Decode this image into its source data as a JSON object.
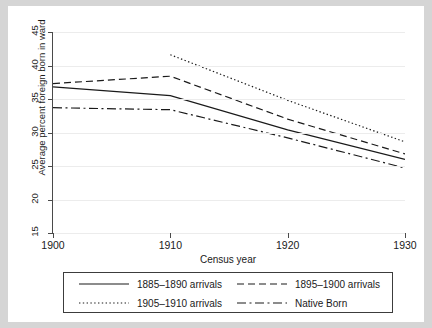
{
  "chart_data": {
    "type": "line",
    "title": "",
    "xlabel": "Census year",
    "ylabel": "Average percent foreign born in ward",
    "x": [
      1900,
      1910,
      1920,
      1930
    ],
    "xlim": [
      1900,
      1930
    ],
    "ylim": [
      15,
      45
    ],
    "xticks": [
      "1900",
      "1910",
      "1920",
      "1930"
    ],
    "yticks": [
      "15",
      "20",
      "25",
      "30",
      "35",
      "40",
      "45"
    ],
    "grid": "horizontal",
    "legend_position": "below-axes",
    "series": [
      {
        "name": "1885–1890 arrivals",
        "style": "solid",
        "x": [
          1900,
          1910,
          1920,
          1930
        ],
        "values": [
          36.8,
          35.5,
          30.4,
          26.0
        ]
      },
      {
        "name": "1895–1900 arrivals",
        "style": "dashed",
        "x": [
          1900,
          1910,
          1920,
          1930
        ],
        "values": [
          37.3,
          38.4,
          32.0,
          26.8
        ]
      },
      {
        "name": "1905–1910 arrivals",
        "style": "dotted",
        "x": [
          1910,
          1920,
          1930
        ],
        "values": [
          41.6,
          34.8,
          28.6
        ]
      },
      {
        "name": "Native Born",
        "style": "dash-dot",
        "x": [
          1900,
          1910,
          1920,
          1930
        ],
        "values": [
          33.7,
          33.4,
          29.2,
          24.7
        ]
      }
    ]
  }
}
